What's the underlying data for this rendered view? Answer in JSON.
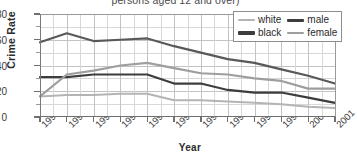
{
  "chart_data": {
    "type": "line",
    "title": "persons aged 12 and over)",
    "xlabel": "Year",
    "ylabel": "Crime Rate",
    "x": [
      "1990",
      "1991",
      "1992",
      "1993",
      "1994",
      "1995",
      "1996",
      "1997",
      "1998",
      "1999",
      "2000",
      "2001"
    ],
    "categories": [
      "1990",
      "1991",
      "1992",
      "1993",
      "1994",
      "1995",
      "1996",
      "1997",
      "1998",
      "1999",
      "2000",
      "2001"
    ],
    "ylim": [
      0,
      80
    ],
    "yticks": [
      0,
      20,
      40,
      60,
      80
    ],
    "yticklabels": [
      "0",
      "20",
      "40",
      "60",
      "80"
    ],
    "yminorticks": [
      10,
      30,
      50,
      70
    ],
    "grid": true,
    "legend_position": "top-right",
    "series": [
      {
        "name": "white",
        "color": "#b4b4b4",
        "width": 2.0,
        "values": [
          16,
          17,
          17,
          18,
          18,
          13,
          13,
          12,
          11,
          10,
          8,
          7
        ]
      },
      {
        "name": "black",
        "color": "#595959",
        "width": 2.2,
        "values": [
          58,
          65,
          59,
          60,
          61,
          55,
          50,
          45,
          42,
          37,
          32,
          26
        ]
      },
      {
        "name": "male",
        "color": "#3d3d3d",
        "width": 2.2,
        "values": [
          31,
          31,
          33,
          33,
          33,
          26,
          26,
          21,
          19,
          19,
          15,
          11
        ]
      },
      {
        "name": "female",
        "color": "#9e9e9e",
        "width": 2.2,
        "values": [
          16,
          33,
          36,
          40,
          42,
          38,
          34,
          33,
          30,
          28,
          22,
          22
        ]
      }
    ]
  },
  "legend": {
    "rows": [
      [
        {
          "label": "white",
          "color": "#b4b4b4",
          "width": 2.0
        },
        {
          "label": "male",
          "color": "#3d3d3d",
          "width": 3.0
        }
      ],
      [
        {
          "label": "black",
          "color": "#3d3d3d",
          "width": 3.2
        },
        {
          "label": "female",
          "color": "#9e9e9e",
          "width": 2.2
        }
      ]
    ]
  },
  "axes": {
    "frame_color": "#6f6f6f",
    "grid_color": "#d8d8d8"
  }
}
